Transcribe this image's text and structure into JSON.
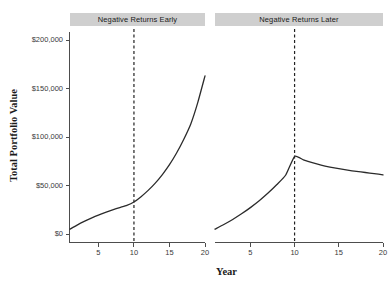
{
  "chart_data": {
    "type": "line",
    "title": "",
    "xlabel": "Year",
    "ylabel": "Total Portfolio Value",
    "xlim": [
      1,
      20
    ],
    "ylim": [
      0,
      205000
    ],
    "grid": false,
    "legend": false,
    "facets": [
      {
        "label": "Negative Returns Early",
        "annotation": {
          "type": "vline",
          "x": 10,
          "style": "dashed",
          "color": "#222222"
        },
        "x": [
          1,
          2,
          3,
          4,
          5,
          6,
          7,
          8,
          9,
          10,
          11,
          12,
          13,
          14,
          15,
          16,
          17,
          18,
          19,
          20
        ],
        "values": [
          5000,
          9200,
          13000,
          16400,
          19500,
          22300,
          24900,
          27300,
          29500,
          33000,
          38500,
          45000,
          52500,
          61300,
          71500,
          83500,
          97500,
          113500,
          136000,
          163000
        ]
      },
      {
        "label": "Negative Returns Later",
        "annotation": {
          "type": "vline",
          "x": 10,
          "style": "dashed",
          "color": "#222222"
        },
        "x": [
          1,
          2,
          3,
          4,
          5,
          6,
          7,
          8,
          9,
          10,
          11,
          12,
          13,
          14,
          15,
          16,
          17,
          18,
          19,
          20
        ],
        "values": [
          5000,
          9800,
          15000,
          20800,
          27200,
          34300,
          42200,
          51000,
          60800,
          80000,
          76500,
          73500,
          71000,
          69000,
          67300,
          65800,
          64500,
          63400,
          62300,
          61000
        ]
      }
    ],
    "y_ticks": [
      {
        "value": 0,
        "label": "$0"
      },
      {
        "value": 50000,
        "label": "$50,000"
      },
      {
        "value": 100000,
        "label": "$100,000"
      },
      {
        "value": 150000,
        "label": "$150,000"
      },
      {
        "value": 200000,
        "label": "$200,000"
      }
    ],
    "x_ticks": [
      {
        "value": 5,
        "label": "5"
      },
      {
        "value": 10,
        "label": "10"
      },
      {
        "value": 15,
        "label": "15"
      },
      {
        "value": 20,
        "label": "20"
      }
    ],
    "colors": {
      "line": "#2b2b2b",
      "axis": "#4d4d4d",
      "strip_background": "#cfcfcf",
      "strip_text": "#1a1a1a",
      "reference_line": "#222222",
      "background": "#ffffff"
    }
  }
}
